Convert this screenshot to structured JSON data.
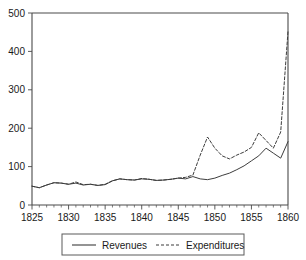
{
  "chart_data": {
    "type": "line",
    "title": "",
    "subtitle": "",
    "xlabel": "",
    "ylabel": "",
    "xlim": [
      1825,
      1860
    ],
    "ylim": [
      0,
      500
    ],
    "grid": false,
    "legend_position": "bottom",
    "x_ticks": [
      1825,
      1830,
      1835,
      1840,
      1845,
      1850,
      1855,
      1860
    ],
    "x_tick_labels": [
      "1825",
      "1830",
      "1835",
      "1840",
      "1845",
      "1850",
      "1855",
      "1860"
    ],
    "x_minor_tick_step": 1,
    "y_ticks": [
      0,
      100,
      200,
      300,
      400,
      500
    ],
    "y_tick_labels": [
      "0",
      "100",
      "200",
      "300",
      "400",
      "500"
    ],
    "x": [
      1825,
      1826,
      1827,
      1828,
      1829,
      1830,
      1831,
      1832,
      1833,
      1834,
      1835,
      1836,
      1837,
      1838,
      1839,
      1840,
      1841,
      1842,
      1843,
      1844,
      1845,
      1846,
      1847,
      1848,
      1849,
      1850,
      1851,
      1852,
      1853,
      1854,
      1855,
      1856,
      1857,
      1858,
      1859,
      1860
    ],
    "series": [
      {
        "name": "Revenues",
        "style": "solid",
        "color": "#3d3d3d",
        "values": [
          49,
          45,
          52,
          58,
          57,
          54,
          57,
          52,
          54,
          51,
          53,
          63,
          68,
          66,
          65,
          68,
          67,
          64,
          65,
          67,
          70,
          68,
          74,
          68,
          66,
          70,
          77,
          83,
          92,
          102,
          115,
          128,
          148,
          135,
          122,
          165
        ]
      },
      {
        "name": "Expenditures",
        "style": "dashed",
        "color": "#3d3d3d",
        "values": [
          49,
          45,
          52,
          58,
          57,
          54,
          60,
          53,
          54,
          51,
          54,
          63,
          68,
          66,
          65,
          69,
          67,
          64,
          65,
          67,
          70,
          72,
          78,
          130,
          177,
          148,
          128,
          120,
          130,
          138,
          150,
          188,
          168,
          148,
          190,
          452
        ]
      }
    ],
    "legend_entries": [
      {
        "label": "Revenues",
        "style": "solid"
      },
      {
        "label": "Expenditures",
        "style": "dashed"
      }
    ]
  }
}
